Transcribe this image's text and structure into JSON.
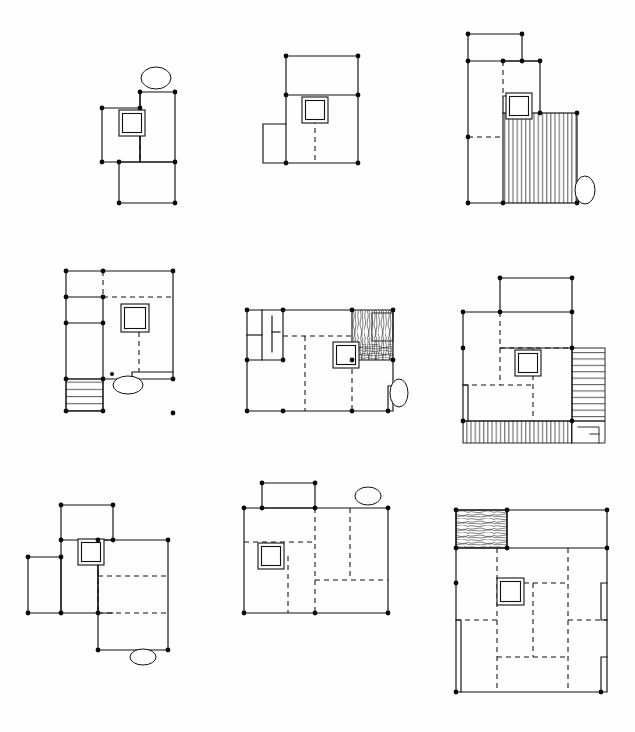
{
  "sheet": {
    "title": "Architectural Floor Plan Variation Study",
    "description": "Nine hand-drawn schematic floor plan sketches arranged in a three by three grid",
    "background_color": "#fefefe",
    "ink_color": "#111111",
    "node_color": "#0a0a0a",
    "columns": 3,
    "rows": 3,
    "panel_count": 9,
    "line_styles": {
      "solid_label": "solid wall",
      "dashed_label": "dashed partition",
      "node_label": "corner node",
      "core_label": "stair core symbol",
      "hatch_vertical_label": "vertical hatch fill",
      "hatch_horizontal_label": "stair tread hatch",
      "scribble_label": "scribble texture fill",
      "ellipse_label": "ellipse annotation"
    }
  },
  "panels": [
    {
      "id": "panel-1",
      "row": 1,
      "column": 1,
      "label": "Plan variant 1",
      "notes": "L-shaped plan, upper-right block, lower offset wing, single ellipse above",
      "has_ellipse": true,
      "ellipse_count": 1,
      "hatch": "none",
      "core_count": 1
    },
    {
      "id": "panel-2",
      "row": 1,
      "column": 2,
      "label": "Plan variant 2",
      "notes": "Rectangular plan with upper band and small left annex",
      "has_ellipse": false,
      "ellipse_count": 0,
      "hatch": "none",
      "core_count": 1
    },
    {
      "id": "panel-3",
      "row": 1,
      "column": 3,
      "label": "Plan variant 3",
      "notes": "Stepped plan with vertical hatch filled lower-right block and ellipse at right",
      "has_ellipse": true,
      "ellipse_count": 1,
      "hatch": "vertical",
      "core_count": 1
    },
    {
      "id": "panel-4",
      "row": 2,
      "column": 1,
      "label": "Plan variant 4",
      "notes": "Square plan with left strip of cells, horizontal hatch stair at lower left, ellipse below",
      "has_ellipse": true,
      "ellipse_count": 1,
      "hatch": "horizontal",
      "core_count": 1
    },
    {
      "id": "panel-5",
      "row": 2,
      "column": 2,
      "label": "Plan variant 5",
      "notes": "Wide plan with narrow left service bay and scribble textured upper-right corner, ellipse at right",
      "has_ellipse": true,
      "ellipse_count": 1,
      "hatch": "scribble",
      "core_count": 1
    },
    {
      "id": "panel-6",
      "row": 2,
      "column": 3,
      "label": "Plan variant 6",
      "notes": "Plan with stair hatch band at right edge and stair treads along the bottom",
      "has_ellipse": false,
      "ellipse_count": 0,
      "hatch": "stairs",
      "core_count": 1
    },
    {
      "id": "panel-7",
      "row": 3,
      "column": 1,
      "label": "Plan variant 7",
      "notes": "Pinwheel composition with upper block, left annex and lower-right wing, ellipse below",
      "has_ellipse": true,
      "ellipse_count": 1,
      "hatch": "none",
      "core_count": 1
    },
    {
      "id": "panel-8",
      "row": 3,
      "column": 2,
      "label": "Plan variant 8",
      "notes": "Rectangular plan with upper projecting block and ellipse above right",
      "has_ellipse": true,
      "ellipse_count": 1,
      "hatch": "none",
      "core_count": 1
    },
    {
      "id": "panel-9",
      "row": 3,
      "column": 3,
      "label": "Plan variant 9",
      "notes": "Large plan with scribble textured upper-left block and dense dashed grid of rooms",
      "has_ellipse": false,
      "ellipse_count": 0,
      "hatch": "scribble",
      "core_count": 1
    }
  ]
}
